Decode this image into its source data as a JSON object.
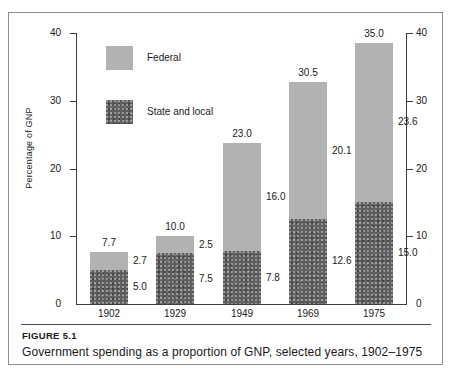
{
  "figure": {
    "number_label": "FIGURE 5.1",
    "caption": "Government spending as a proportion of GNP, selected years, 1902–1975"
  },
  "legend": {
    "position": "inside-top-left",
    "entries": [
      {
        "label": "Federal",
        "color": "#b2b2b2",
        "swatch_name": "federal-swatch"
      },
      {
        "label": "State and local",
        "color": "#5e5e5e",
        "swatch_name": "state-and-local-swatch"
      }
    ]
  },
  "axes": {
    "y_title": "Percentage of GNP",
    "y_ticks": [
      "0",
      "10",
      "20",
      "30",
      "40"
    ],
    "y_ticks_right": [
      "0",
      "10",
      "20",
      "30",
      "40"
    ],
    "y_min": 0,
    "y_max": 40
  },
  "chart_data": {
    "type": "bar",
    "subtype": "stacked",
    "title": "Government spending as a proportion of GNP, selected years, 1902–1975",
    "xlabel": "",
    "ylabel": "Percentage of GNP",
    "ylim": [
      0,
      40
    ],
    "yticks": [
      0,
      10,
      20,
      30,
      40
    ],
    "grid": false,
    "legend_position": "inside-top-left",
    "categories": [
      "1902",
      "1929",
      "1949",
      "1969",
      "1975"
    ],
    "series": [
      {
        "name": "State and local",
        "color": "#5e5e5e",
        "values": [
          5.0,
          7.5,
          7.8,
          12.6,
          15.0
        ]
      },
      {
        "name": "Federal",
        "color": "#b2b2b2",
        "values": [
          2.7,
          2.5,
          16.0,
          20.1,
          23.6
        ]
      }
    ],
    "totals": [
      7.7,
      10.0,
      23.0,
      30.5,
      35.0
    ],
    "data_labels": {
      "totals": [
        "7.7",
        "10.0",
        "23.0",
        "30.5",
        "35.0"
      ],
      "federal": [
        "2.7",
        "2.5",
        "16.0",
        "20.1",
        "23.6"
      ],
      "state_and_local": [
        "5.0",
        "7.5",
        "7.8",
        "12.6",
        "15.0"
      ]
    }
  },
  "bars": [
    {
      "year": "1902",
      "total": "7.7",
      "federal": "2.7",
      "state": "5.0",
      "total_val": 7.7,
      "federal_val": 2.7,
      "state_val": 5.0
    },
    {
      "year": "1929",
      "total": "10.0",
      "federal": "2.5",
      "state": "7.5",
      "total_val": 10.0,
      "federal_val": 2.5,
      "state_val": 7.5
    },
    {
      "year": "1949",
      "total": "23.0",
      "federal": "16.0",
      "state": "7.8",
      "total_val": 23.0,
      "federal_val": 16.0,
      "state_val": 7.8
    },
    {
      "year": "1969",
      "total": "30.5",
      "federal": "20.1",
      "state": "12.6",
      "total_val": 30.5,
      "federal_val": 20.1,
      "state_val": 12.6
    },
    {
      "year": "1975",
      "total": "35.0",
      "federal": "23.6",
      "state": "15.0",
      "total_val": 35.0,
      "federal_val": 23.6,
      "state_val": 15.0
    }
  ]
}
